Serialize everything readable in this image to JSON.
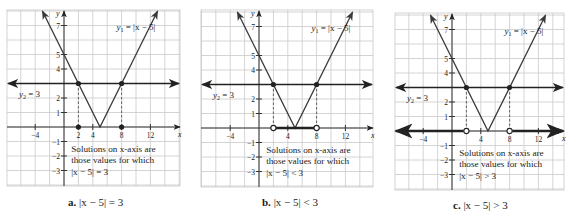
{
  "chart_data": [
    {
      "id": "a",
      "type": "line",
      "title": "|x − 5| = 3",
      "caption_letter": "a.",
      "caption_text": "|x − 5| = 3",
      "functions": [
        {
          "name": "y1",
          "label": "y",
          "sub": "1",
          "expr": " = |x − 5|",
          "kind": "abs",
          "h": 5
        },
        {
          "name": "y2",
          "label": "y",
          "sub": "2",
          "expr": " = 3",
          "kind": "const",
          "c": 3
        }
      ],
      "intersections": [
        {
          "x": 2,
          "y": 3
        },
        {
          "x": 8,
          "y": 3
        }
      ],
      "xaxis": {
        "label": "x",
        "ticks": [
          -4,
          2,
          4,
          8,
          12
        ],
        "range": [
          -8,
          16
        ]
      },
      "yaxis": {
        "label": "y",
        "ticks": [
          7,
          5,
          4,
          2,
          1,
          -1,
          -2,
          -3
        ],
        "range": [
          -4,
          8
        ]
      },
      "solution": {
        "type": "points",
        "x": [
          2,
          8
        ],
        "marker": "filled"
      },
      "note": [
        "Solutions on x-axis are",
        "those values for which",
        "|x − 5| = 3"
      ],
      "grid": true
    },
    {
      "id": "b",
      "type": "line",
      "title": "|x − 5| < 3",
      "caption_letter": "b.",
      "caption_text": "|x − 5| < 3",
      "functions": [
        {
          "name": "y1",
          "label": "y",
          "sub": "1",
          "expr": " = |x − 5|",
          "kind": "abs",
          "h": 5
        },
        {
          "name": "y2",
          "label": "y",
          "sub": "2",
          "expr": " = 3",
          "kind": "const",
          "c": 3
        }
      ],
      "intersections": [
        {
          "x": 2,
          "y": 3
        },
        {
          "x": 8,
          "y": 3
        }
      ],
      "xaxis": {
        "label": "x",
        "ticks": [
          -4,
          4,
          8,
          12
        ],
        "range": [
          -8,
          16
        ]
      },
      "yaxis": {
        "label": "y",
        "ticks": [
          7,
          5,
          4,
          2,
          1,
          -1,
          -2,
          -3
        ],
        "range": [
          -4,
          8
        ]
      },
      "solution": {
        "type": "interval",
        "from": 2,
        "to": 8,
        "marker": "open"
      },
      "note": [
        "Solutions on x-axis are",
        "those values for which",
        "|x − 5| < 3"
      ],
      "grid": true
    },
    {
      "id": "c",
      "type": "line",
      "title": "|x − 5| > 3",
      "caption_letter": "c.",
      "caption_text": "|x − 5| > 3",
      "functions": [
        {
          "name": "y1",
          "label": "y",
          "sub": "1",
          "expr": " = |x − 5|",
          "kind": "abs",
          "h": 5
        },
        {
          "name": "y2",
          "label": "y",
          "sub": "2",
          "expr": " = 3",
          "kind": "const",
          "c": 3
        }
      ],
      "intersections": [
        {
          "x": 2,
          "y": 3
        },
        {
          "x": 8,
          "y": 3
        }
      ],
      "xaxis": {
        "label": "x",
        "ticks": [
          -4,
          4,
          8,
          12
        ],
        "range": [
          -8,
          16
        ]
      },
      "yaxis": {
        "label": "y",
        "ticks": [
          7,
          5,
          4,
          2,
          1,
          -1,
          -2,
          -3
        ],
        "range": [
          -4,
          8
        ]
      },
      "solution": {
        "type": "rays",
        "left_to": 2,
        "right_from": 8,
        "marker": "open"
      },
      "note": [
        "Solutions on x-axis are",
        "those values for which",
        "|x − 5| > 3"
      ],
      "grid": true
    }
  ],
  "colors": {
    "grid": "#c9c9c9",
    "axis": "#333333",
    "curve": "#3a3a3a",
    "line": "#222222",
    "text": "#222222",
    "dashed": "#555555"
  },
  "layout": [
    {
      "left": 7,
      "top": 10,
      "right": 180,
      "bottom": 186,
      "ox": 64,
      "oy": 127,
      "caption_x": 68,
      "caption_y": 196
    },
    {
      "left": 201,
      "top": 10,
      "right": 373,
      "bottom": 187,
      "ox": 259,
      "oy": 128,
      "caption_x": 262,
      "caption_y": 196
    },
    {
      "left": 395,
      "top": 13,
      "right": 564,
      "bottom": 190,
      "ox": 452,
      "oy": 131,
      "caption_x": 453,
      "caption_y": 199
    }
  ]
}
